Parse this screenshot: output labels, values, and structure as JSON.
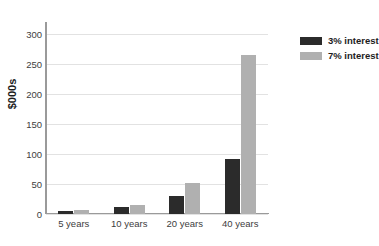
{
  "chart_data": {
    "type": "bar",
    "title": "",
    "xlabel": "",
    "ylabel": "$000s",
    "categories": [
      "5 years",
      "10 years",
      "20 years",
      "40 years"
    ],
    "series": [
      {
        "name": "3% interest",
        "color": "#2b2b2b",
        "values": [
          5,
          11,
          30,
          92
        ]
      },
      {
        "name": "7% interest",
        "color": "#b0b0b0",
        "values": [
          7,
          15,
          52,
          265
        ]
      }
    ],
    "ylim": [
      0,
      300
    ],
    "yticks": [
      0,
      50,
      100,
      150,
      200,
      250,
      300
    ],
    "ytick_labels": [
      "0",
      "50",
      "100",
      "150",
      "200",
      "250",
      "300"
    ],
    "grid": true,
    "legend_position": "right"
  },
  "colors": {
    "background": "#ffffff",
    "axis": "#9a9a9a",
    "grid": "#e2e2e2",
    "text": "#404040",
    "title_text": "#1d1d1d"
  }
}
